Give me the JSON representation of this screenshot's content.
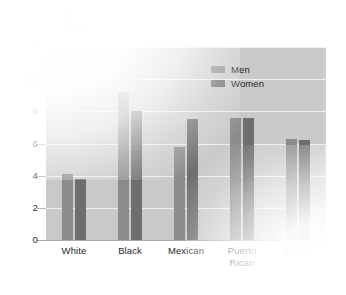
{
  "chart_data": {
    "type": "bar",
    "title": "",
    "axis_title_lines": [
      "Percent",
      "unemployed"
    ],
    "ylabel": "Percent unemployed",
    "xlabel": "",
    "ylim": [
      0,
      12
    ],
    "yticks": [
      12,
      10,
      8,
      6,
      4,
      2,
      0
    ],
    "ytick_labels": [
      "12",
      "10",
      "8",
      "6",
      "4",
      "2",
      "0"
    ],
    "grid": true,
    "legend_position": "top-right-inside",
    "categories": [
      "White",
      "Black",
      "Mexican",
      "Puerto Rican",
      "Cuban"
    ],
    "category_label_lines": [
      [
        "White"
      ],
      [
        "Black"
      ],
      [
        "Mexican"
      ],
      [
        "Puerto",
        "Rican"
      ],
      [
        "Cuban"
      ]
    ],
    "series": [
      {
        "name": "Men",
        "color": "#8c8c8c",
        "values": [
          4.1,
          9.2,
          5.8,
          7.6,
          6.3
        ]
      },
      {
        "name": "Women",
        "color": "#6e6e6e",
        "values": [
          3.8,
          8.0,
          7.5,
          7.6,
          6.2
        ]
      }
    ]
  },
  "legend": {
    "items": [
      {
        "label": "Men",
        "color": "#8c8c8c"
      },
      {
        "label": "Women",
        "color": "#6e6e6e"
      }
    ]
  },
  "colors": {
    "plot_background": "#c9c9c9",
    "page_background": "#ffffff",
    "gridline": "#efefef",
    "baseline": "#a8a8a8",
    "text": "#1f1f1f",
    "series_men": "#8c8c8c",
    "series_women": "#6e6e6e"
  }
}
